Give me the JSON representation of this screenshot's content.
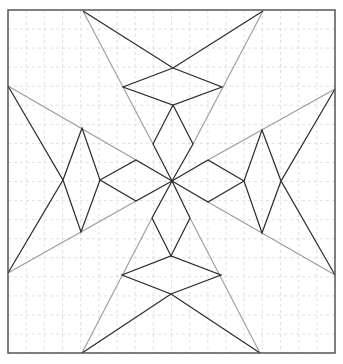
{
  "diagram": {
    "title": "",
    "frame": {
      "x": 8,
      "y": 10,
      "width": 327,
      "height": 343,
      "stroke": "#555555"
    },
    "grid": {
      "spacing_x": 18.17,
      "spacing_y": 19.06,
      "stroke": "#d8d8d8",
      "dash": "3,3"
    },
    "colors": {
      "black_line": "#2a2a2a",
      "gray_line": "#9a9a9a"
    },
    "center": [
      172,
      181
    ],
    "gray_lines": [
      [
        [
          83,
          11
        ],
        [
          153,
          144
        ]
      ],
      [
        [
          263,
          11
        ],
        [
          193,
          144
        ]
      ],
      [
        [
          8,
          86
        ],
        [
          136,
          160
        ]
      ],
      [
        [
          335,
          89
        ],
        [
          208,
          160
        ]
      ],
      [
        [
          8,
          273
        ],
        [
          136,
          201
        ]
      ],
      [
        [
          335,
          275
        ],
        [
          208,
          202
        ]
      ],
      [
        [
          82,
          353
        ],
        [
          152,
          218
        ]
      ],
      [
        [
          260,
          353
        ],
        [
          190,
          218
        ]
      ]
    ],
    "black_polylines": [
      [
        [
          83,
          11
        ],
        [
          173,
          68
        ],
        [
          222,
          87
        ],
        [
          173,
          105
        ],
        [
          123,
          87
        ],
        [
          173,
          68
        ],
        [
          263,
          11
        ]
      ],
      [
        [
          173,
          105
        ],
        [
          153,
          144
        ],
        [
          172,
          181
        ]
      ],
      [
        [
          173,
          105
        ],
        [
          193,
          144
        ],
        [
          172,
          181
        ]
      ],
      [
        [
          82,
          353
        ],
        [
          171,
          294
        ],
        [
          221,
          275
        ],
        [
          171,
          256
        ],
        [
          122,
          275
        ],
        [
          171,
          294
        ],
        [
          260,
          353
        ]
      ],
      [
        [
          171,
          256
        ],
        [
          152,
          218
        ],
        [
          172,
          181
        ]
      ],
      [
        [
          171,
          256
        ],
        [
          190,
          218
        ],
        [
          172,
          181
        ]
      ],
      [
        [
          8,
          86
        ],
        [
          63,
          180
        ],
        [
          82,
          128
        ],
        [
          100,
          180
        ],
        [
          81,
          232
        ],
        [
          63,
          180
        ],
        [
          8,
          273
        ]
      ],
      [
        [
          100,
          180
        ],
        [
          136,
          160
        ],
        [
          172,
          181
        ]
      ],
      [
        [
          100,
          180
        ],
        [
          136,
          201
        ],
        [
          172,
          181
        ]
      ],
      [
        [
          335,
          89
        ],
        [
          281,
          181
        ],
        [
          262,
          130
        ],
        [
          244,
          181
        ],
        [
          262,
          233
        ],
        [
          281,
          181
        ],
        [
          335,
          275
        ]
      ],
      [
        [
          244,
          181
        ],
        [
          208,
          160
        ],
        [
          172,
          181
        ]
      ],
      [
        [
          244,
          181
        ],
        [
          208,
          202
        ],
        [
          172,
          181
        ]
      ]
    ]
  }
}
